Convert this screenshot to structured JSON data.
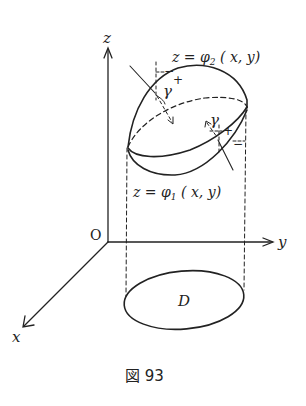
{
  "figure": {
    "caption": "図 93",
    "colors": {
      "ink": "#222222",
      "background": "#ffffff"
    }
  },
  "axes": {
    "z_label": "z",
    "y_label": "y",
    "x_label": "x",
    "origin_label": "O"
  },
  "surfaces": {
    "upper": {
      "eq_lhs": "z = ",
      "func": "φ",
      "sub": "2",
      "args": " ( x, y)"
    },
    "lower": {
      "eq_lhs": "z = ",
      "func": "φ",
      "sub": "1",
      "args": " ( x, y)"
    }
  },
  "annotations": {
    "gamma_upper": "γ",
    "gamma_lower": "γ",
    "upper_minus": "−",
    "upper_plus": "+",
    "lower_plus": "+",
    "lower_minus": "−"
  },
  "region": {
    "label": "D"
  }
}
